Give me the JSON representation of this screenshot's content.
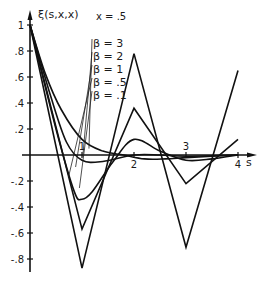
{
  "chart_data": {
    "type": "line",
    "title": "",
    "ylabel": "ξ(s,x,x)",
    "xlabel": "s",
    "annotation": "x = .5",
    "xlim": [
      0,
      4.3
    ],
    "ylim": [
      -0.9,
      1.05
    ],
    "grid": false,
    "x_ticks": [
      {
        "value": 1,
        "label": "1"
      },
      {
        "value": 2,
        "label": "2"
      },
      {
        "value": 3,
        "label": "3"
      },
      {
        "value": 4,
        "label": "4"
      }
    ],
    "y_ticks": [
      {
        "value": 1,
        "label": "1"
      },
      {
        "value": 0.8,
        "label": ".8"
      },
      {
        "value": 0.6,
        "label": ".6"
      },
      {
        "value": 0.4,
        "label": ".4"
      },
      {
        "value": 0.2,
        "label": ".2"
      },
      {
        "value": -0.2,
        "label": "-.2"
      },
      {
        "value": -0.4,
        "label": "-.4"
      },
      {
        "value": -0.6,
        "label": "-.6"
      },
      {
        "value": -0.8,
        "label": "-.8"
      }
    ],
    "legend_placement": "top-center",
    "series": [
      {
        "name": "β = 3",
        "smooth": false,
        "points": [
          [
            0,
            1.0
          ],
          [
            1,
            -0.87
          ],
          [
            2,
            0.78
          ],
          [
            3,
            -0.71
          ],
          [
            4,
            0.65
          ]
        ]
      },
      {
        "name": "β = 2",
        "smooth": false,
        "points": [
          [
            0,
            1.0
          ],
          [
            1,
            -0.57
          ],
          [
            2,
            0.36
          ],
          [
            3,
            -0.22
          ],
          [
            4,
            0.12
          ]
        ]
      },
      {
        "name": "β = 1",
        "smooth": true,
        "points": [
          [
            0,
            1.0
          ],
          [
            0.5,
            0.2
          ],
          [
            0.85,
            -0.28
          ],
          [
            1.0,
            -0.34
          ],
          [
            1.2,
            -0.28
          ],
          [
            1.6,
            -0.05
          ],
          [
            2,
            0.12
          ],
          [
            2.5,
            0.03
          ],
          [
            3,
            -0.04
          ],
          [
            3.5,
            -0.03
          ],
          [
            4,
            0.0
          ]
        ]
      },
      {
        "name": "β = .5",
        "smooth": true,
        "points": [
          [
            0,
            1.0
          ],
          [
            0.4,
            0.45
          ],
          [
            0.7,
            0.1
          ],
          [
            1.0,
            -0.04
          ],
          [
            1.4,
            -0.05
          ],
          [
            2,
            0.0
          ],
          [
            2.5,
            0.0
          ],
          [
            3,
            -0.01
          ],
          [
            4,
            0.0
          ]
        ]
      },
      {
        "name": "β = .1",
        "smooth": true,
        "points": [
          [
            0,
            1.0
          ],
          [
            0.3,
            0.62
          ],
          [
            0.6,
            0.35
          ],
          [
            1.0,
            0.12
          ],
          [
            1.4,
            0.03
          ],
          [
            1.8,
            0.0
          ],
          [
            2.2,
            -0.03
          ],
          [
            2.6,
            -0.03
          ],
          [
            3.0,
            -0.02
          ],
          [
            3.5,
            -0.01
          ],
          [
            4,
            0.0
          ]
        ]
      }
    ]
  }
}
